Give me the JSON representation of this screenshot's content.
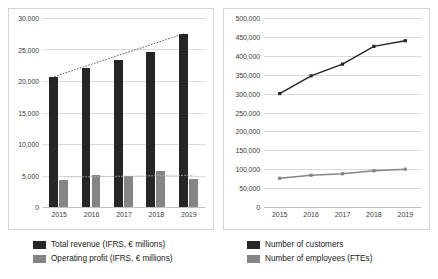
{
  "charts": {
    "left": {
      "y_ticks": [
        "30,000",
        "25,000",
        "20,000",
        "15,000",
        "10,000",
        "5,000",
        "0"
      ],
      "x_labels": [
        "2015",
        "2016",
        "2017",
        "2018",
        "2019"
      ],
      "legend": [
        {
          "label": "Total revenue (IFRS, € millions)",
          "color": "#262626",
          "swatch": "dark"
        },
        {
          "label": "Operating profit (IFRS, € millions)",
          "color": "#858585",
          "swatch": "gray"
        }
      ]
    },
    "right": {
      "y_ticks": [
        "500,000",
        "450,000",
        "400,000",
        "350,000",
        "300,000",
        "250,000",
        "200,000",
        "150,000",
        "100,000",
        "50,000",
        "0"
      ],
      "x_labels": [
        "2015",
        "2016",
        "2017",
        "2018",
        "2019"
      ],
      "legend": [
        {
          "label": "Number of customers",
          "color": "#262626",
          "swatch": "dark"
        },
        {
          "label": "Number of employees (FTEs)",
          "color": "#858585",
          "swatch": "gray"
        }
      ]
    }
  },
  "chart_data": [
    {
      "type": "bar",
      "id": "revenue-profit-bar-chart",
      "title": "",
      "xlabel": "",
      "ylabel": "",
      "categories": [
        "2015",
        "2016",
        "2017",
        "2018",
        "2019"
      ],
      "ylim": [
        0,
        30000
      ],
      "ytick_step": 5000,
      "grid": true,
      "legend_position": "bottom",
      "series": [
        {
          "name": "Total revenue (IFRS, € millions)",
          "color": "#262626",
          "values": [
            20700,
            22000,
            23400,
            24600,
            27500
          ]
        },
        {
          "name": "Operating profit (IFRS, € millions)",
          "color": "#858585",
          "values": [
            4300,
            5100,
            4900,
            5700,
            4500
          ]
        }
      ],
      "trendlines": [
        {
          "for": "Total revenue (IFRS, € millions)",
          "style": "dotted",
          "from": 20700,
          "to": 27500
        },
        {
          "for": "Operating profit (IFRS, € millions)",
          "style": "dotted",
          "from": 4750,
          "to": 5050
        }
      ]
    },
    {
      "type": "line",
      "id": "customers-employees-line-chart",
      "title": "",
      "xlabel": "",
      "ylabel": "",
      "categories": [
        "2015",
        "2016",
        "2017",
        "2018",
        "2019"
      ],
      "ylim": [
        0,
        500000
      ],
      "ytick_step": 50000,
      "grid": true,
      "legend_position": "bottom",
      "markers": true,
      "series": [
        {
          "name": "Number of customers",
          "color": "#262626",
          "values": [
            300000,
            347000,
            378000,
            425000,
            440000
          ]
        },
        {
          "name": "Number of employees (FTEs)",
          "color": "#858585",
          "values": [
            76000,
            84000,
            88000,
            96000,
            100000
          ]
        }
      ]
    }
  ]
}
